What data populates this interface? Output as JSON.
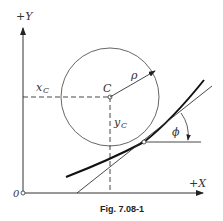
{
  "figure": {
    "caption": "Fig. 7.08-1",
    "labels": {
      "y_axis": "+Y",
      "x_axis": "+X",
      "origin": "0",
      "center": "C",
      "radius": "ρ",
      "xc": "x",
      "xc_sub": "C",
      "yc": "y",
      "yc_sub": "C",
      "angle": "ϕ"
    }
  }
}
